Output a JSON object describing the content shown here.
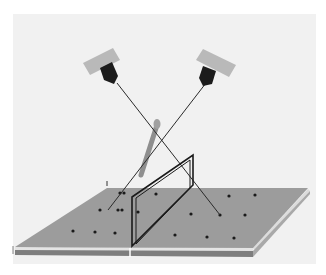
{
  "figure": {
    "background_color": "#f1f1f1",
    "border_color": "#ffffff"
  },
  "cameras": [
    {
      "name": "left-camera",
      "body_color": "#b9b9b9",
      "lens_color": "#1c1c1c"
    },
    {
      "name": "right-camera",
      "body_color": "#b9b9b9",
      "lens_color": "#1c1c1c"
    }
  ],
  "platform": {
    "top_color": "#9c9c9c",
    "edge_color": "#e6e6e6",
    "side_color": "#7a7a7a",
    "marker_count": 17
  },
  "frame": {
    "color": "#1a1a1a"
  },
  "probe": {
    "color": "#8e8e8e"
  }
}
